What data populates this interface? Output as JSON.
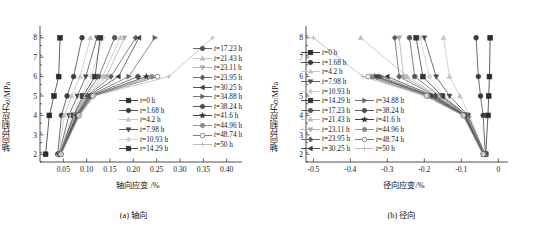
{
  "figure": {
    "panel_a": {
      "caption": "(a) 轴向",
      "ylabel": "轴向控制应力σ/MPa",
      "xlabel": "轴向应变 /%"
    },
    "panel_b": {
      "caption": "(b) 径向",
      "ylabel": "轴向控制应力σ/MPa",
      "xlabel": "径向应变/%"
    }
  },
  "chart_data": [
    {
      "type": "line",
      "panel": "(a) 轴向",
      "title": "",
      "xlabel": "轴向应变 /%",
      "ylabel": "轴向控制应力σ/MPa",
      "xlim": [
        0.0,
        0.42
      ],
      "ylim": [
        1.6,
        8.4
      ],
      "xticks": [
        "0.05",
        "0.10",
        "0.15",
        "0.20",
        "0.25",
        "0.30",
        "0.35",
        "0.40"
      ],
      "xtickvals": [
        0.05,
        0.1,
        0.15,
        0.2,
        0.25,
        0.3,
        0.35,
        0.4
      ],
      "yticks": [
        "2",
        "3",
        "4",
        "5",
        "6",
        "7",
        "8"
      ],
      "ytickvals": [
        2,
        3,
        4,
        5,
        6,
        7,
        8
      ],
      "grid": false,
      "legend_position": "inside-right",
      "series": [
        {
          "name": "t=0 h",
          "marker": "square",
          "fill": "solid",
          "color": "#2b2b2b",
          "x": [
            0.012,
            0.02,
            0.03,
            0.04,
            0.043
          ],
          "y": [
            2,
            4,
            5,
            6,
            8
          ]
        },
        {
          "name": "t=1.68 h",
          "marker": "circle",
          "fill": "solid",
          "color": "#3c3c3c",
          "x": [
            0.038,
            0.046,
            0.058,
            0.072,
            0.09
          ],
          "y": [
            2,
            4,
            5,
            6,
            8
          ]
        },
        {
          "name": "t=4.2 h",
          "marker": "triangle-up",
          "fill": "light",
          "color": "#c3c3c3",
          "x": [
            0.04,
            0.052,
            0.068,
            0.086,
            0.108
          ],
          "y": [
            2,
            4,
            5,
            6,
            8
          ]
        },
        {
          "name": "t=7.98 h",
          "marker": "triangle-down",
          "fill": "solid",
          "color": "#4a4a4a",
          "x": [
            0.041,
            0.062,
            0.08,
            0.098,
            0.122
          ],
          "y": [
            2,
            4,
            5,
            6,
            8
          ]
        },
        {
          "name": "t=10.93 h",
          "marker": "diamond",
          "fill": "light",
          "color": "#cfcfcf",
          "x": [
            0.041,
            0.068,
            0.088,
            0.11,
            0.134
          ],
          "y": [
            2,
            4,
            5,
            6,
            8
          ]
        },
        {
          "name": "t=14.29 h",
          "marker": "square",
          "fill": "solid",
          "color": "#333333",
          "x": [
            0.042,
            0.072,
            0.092,
            0.118,
            0.129
          ],
          "y": [
            2,
            4,
            5,
            6,
            8
          ]
        },
        {
          "name": "t=17.23 h",
          "marker": "circle",
          "fill": "solid",
          "color": "#555555",
          "x": [
            0.042,
            0.074,
            0.096,
            0.126,
            0.16
          ],
          "y": [
            2,
            4,
            5,
            6,
            8
          ]
        },
        {
          "name": "t=21.43 h",
          "marker": "triangle-up",
          "fill": "light",
          "color": "#bdbdbd",
          "x": [
            0.042,
            0.076,
            0.098,
            0.134,
            0.172
          ],
          "y": [
            2,
            4,
            5,
            6,
            8
          ]
        },
        {
          "name": "t=23.11 h",
          "marker": "triangle-down",
          "fill": "light",
          "color": "#aaaaaa",
          "x": [
            0.043,
            0.077,
            0.1,
            0.142,
            0.181
          ],
          "y": [
            2,
            4,
            5,
            6,
            8
          ]
        },
        {
          "name": "t=23.95 h",
          "marker": "diamond",
          "fill": "solid",
          "color": "#5e5e5e",
          "x": [
            0.043,
            0.078,
            0.102,
            0.152,
            0.205
          ],
          "y": [
            2,
            4,
            5,
            6,
            8
          ]
        },
        {
          "name": "t=30.25 h",
          "marker": "triangle-left",
          "fill": "solid",
          "color": "#3f3f3f",
          "x": [
            0.043,
            0.079,
            0.104,
            0.168,
            0.212
          ],
          "y": [
            2,
            4,
            5,
            6,
            8
          ]
        },
        {
          "name": "t=34.88 h",
          "marker": "triangle-right",
          "fill": "solid",
          "color": "#646464",
          "x": [
            0.044,
            0.08,
            0.106,
            0.19,
            0.246
          ],
          "y": [
            2,
            4,
            5,
            6,
            8
          ]
        },
        {
          "name": "t=38.24 h",
          "marker": "hexagon",
          "fill": "solid",
          "color": "#4d4d4d",
          "x": [
            0.044,
            0.081,
            0.108,
            0.21
          ],
          "y": [
            2,
            4,
            5,
            6
          ]
        },
        {
          "name": "t=41.6 h",
          "marker": "star",
          "fill": "solid",
          "color": "#2f2f2f",
          "x": [
            0.044,
            0.082,
            0.11,
            0.228
          ],
          "y": [
            2,
            4,
            5,
            6
          ]
        },
        {
          "name": "t=44.96 h",
          "marker": "circle",
          "fill": "gray",
          "color": "#8a8a8a",
          "x": [
            0.045,
            0.083,
            0.112,
            0.24
          ],
          "y": [
            2,
            4,
            5,
            6
          ]
        },
        {
          "name": "t=48.74 h",
          "marker": "circle-open",
          "fill": "open",
          "color": "#6f6f6f",
          "x": [
            0.045,
            0.084,
            0.114,
            0.252
          ],
          "y": [
            2,
            4,
            5,
            6
          ]
        },
        {
          "name": "t=50 h",
          "marker": "plus",
          "fill": "light",
          "color": "#b5b5b5",
          "x": [
            0.045,
            0.085,
            0.116,
            0.276,
            0.37
          ],
          "y": [
            2,
            4,
            5,
            6,
            8
          ]
        }
      ]
    },
    {
      "type": "line",
      "panel": "(b) 径向",
      "title": "",
      "xlabel": "径向应变/%",
      "ylabel": "轴向控制应力σ/MPa",
      "xlim": [
        -0.52,
        0.01
      ],
      "ylim": [
        1.6,
        8.4
      ],
      "xticks": [
        "-0.5",
        "-0.4",
        "-0.3",
        "-0.2",
        "-0.1",
        "0"
      ],
      "xtickvals": [
        -0.5,
        -0.4,
        -0.3,
        -0.2,
        -0.1,
        0.0
      ],
      "yticks": [
        "2",
        "3",
        "4",
        "5",
        "6",
        "7",
        "8"
      ],
      "ytickvals": [
        2,
        3,
        4,
        5,
        6,
        7,
        8
      ],
      "grid": false,
      "legend_position": "inside-left",
      "series": [
        {
          "name": "t=0 h",
          "marker": "square",
          "fill": "solid",
          "color": "#2b2b2b",
          "x": [
            -0.034,
            -0.028,
            -0.026,
            -0.024,
            -0.022
          ],
          "y": [
            2,
            4,
            5,
            6,
            8
          ]
        },
        {
          "name": "t=1.68 h",
          "marker": "circle",
          "fill": "solid",
          "color": "#3c3c3c",
          "x": [
            -0.035,
            -0.041,
            -0.048,
            -0.054,
            -0.06
          ],
          "y": [
            2,
            4,
            5,
            6,
            8
          ]
        },
        {
          "name": "t=4.2 h",
          "marker": "triangle-up",
          "fill": "light",
          "color": "#c3c3c3",
          "x": [
            -0.036,
            -0.078,
            -0.104,
            -0.132,
            -0.148
          ],
          "y": [
            2,
            4,
            5,
            6,
            8
          ]
        },
        {
          "name": "t=7.98 h",
          "marker": "triangle-down",
          "fill": "solid",
          "color": "#4a4a4a",
          "x": [
            -0.036,
            -0.082,
            -0.132,
            -0.168,
            -0.2
          ],
          "y": [
            2,
            4,
            5,
            6,
            8
          ]
        },
        {
          "name": "t=10.93 h",
          "marker": "diamond",
          "fill": "light",
          "color": "#cfcfcf",
          "x": [
            -0.037,
            -0.084,
            -0.146,
            -0.186,
            -0.212
          ],
          "y": [
            2,
            4,
            5,
            6,
            8
          ]
        },
        {
          "name": "t=14.29 h",
          "marker": "square",
          "fill": "solid",
          "color": "#333333",
          "x": [
            -0.037,
            -0.085,
            -0.152,
            -0.204,
            -0.222
          ],
          "y": [
            2,
            4,
            5,
            6,
            8
          ]
        },
        {
          "name": "t=17.23 h",
          "marker": "circle",
          "fill": "solid",
          "color": "#555555",
          "x": [
            -0.038,
            -0.086,
            -0.158,
            -0.226,
            -0.24
          ],
          "y": [
            2,
            4,
            5,
            6,
            8
          ]
        },
        {
          "name": "t=21.43 h",
          "marker": "triangle-up",
          "fill": "light",
          "color": "#bdbdbd",
          "x": [
            -0.038,
            -0.087,
            -0.162,
            -0.246,
            -0.372
          ],
          "y": [
            2,
            4,
            5,
            6,
            8
          ]
        },
        {
          "name": "t=23.11 h",
          "marker": "triangle-down",
          "fill": "light",
          "color": "#aaaaaa",
          "x": [
            -0.038,
            -0.088,
            -0.166,
            -0.256,
            -0.268
          ],
          "y": [
            2,
            4,
            5,
            6,
            8
          ]
        },
        {
          "name": "t=23.95 h",
          "marker": "diamond",
          "fill": "solid",
          "color": "#5e5e5e",
          "x": [
            -0.039,
            -0.089,
            -0.17,
            -0.268,
            -0.28
          ],
          "y": [
            2,
            4,
            5,
            6,
            8
          ]
        },
        {
          "name": "t=30.25 h",
          "marker": "triangle-left",
          "fill": "solid",
          "color": "#3f3f3f",
          "x": [
            -0.039,
            -0.09,
            -0.174,
            -0.3
          ],
          "y": [
            2,
            4,
            5,
            6
          ]
        },
        {
          "name": "t=34.88 h",
          "marker": "triangle-right",
          "fill": "solid",
          "color": "#646464",
          "x": [
            -0.04,
            -0.091,
            -0.178,
            -0.316
          ],
          "y": [
            2,
            4,
            5,
            6
          ]
        },
        {
          "name": "t=38.24 h",
          "marker": "hexagon",
          "fill": "solid",
          "color": "#4d4d4d",
          "x": [
            -0.04,
            -0.092,
            -0.182,
            -0.326
          ],
          "y": [
            2,
            4,
            5,
            6
          ]
        },
        {
          "name": "t=41.6 h",
          "marker": "star",
          "fill": "solid",
          "color": "#2f2f2f",
          "x": [
            -0.04,
            -0.093,
            -0.186,
            -0.334
          ],
          "y": [
            2,
            4,
            5,
            6
          ]
        },
        {
          "name": "t=44.96 h",
          "marker": "circle",
          "fill": "gray",
          "color": "#8a8a8a",
          "x": [
            -0.041,
            -0.094,
            -0.19,
            -0.342
          ],
          "y": [
            2,
            4,
            5,
            6
          ]
        },
        {
          "name": "t=48.74 h",
          "marker": "circle-open",
          "fill": "open",
          "color": "#6f6f6f",
          "x": [
            -0.041,
            -0.095,
            -0.194,
            -0.352
          ],
          "y": [
            2,
            4,
            5,
            6
          ]
        },
        {
          "name": "t=50 h",
          "marker": "plus",
          "fill": "light",
          "color": "#b5b5b5",
          "x": [
            -0.042,
            -0.096,
            -0.198,
            -0.366,
            -0.5
          ],
          "y": [
            2,
            4,
            5,
            6,
            8
          ]
        }
      ]
    }
  ],
  "legends": {
    "panel_a": {
      "col1": [
        "t=0 h",
        "t=1.68 h",
        "t=4.2 h",
        "t=7.98 h",
        "t=10.93 h",
        "t=14.29 h"
      ],
      "col2": [
        "t=17.23 h",
        "t=21.43 h",
        "t=23.11 h",
        "t=23.95 h",
        "t=30.25 h",
        "t=34.88 h",
        "t=38.24 h",
        "t=41.6 h",
        "t=44.96 h",
        "t=48.74 h",
        "t=50 h"
      ]
    },
    "panel_b": {
      "col1": [
        "t=0 h",
        "t=1.68 h",
        "t=4.2 h",
        "t=7.98 h",
        "t=10.93 h",
        "t=14.29 h",
        "t=17.23 h",
        "t=21.43 h",
        "t=23.11 h",
        "t=23.95 h",
        "t=30.25 h"
      ],
      "col2": [
        "t=34.88 h",
        "t=38.24 h",
        "t=41.6 h",
        "t=44.96 h",
        "t=48.74 h",
        "t=50 h"
      ]
    }
  }
}
